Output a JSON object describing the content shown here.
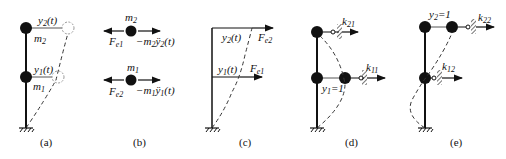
{
  "panels": {
    "a": {
      "caption": "(a)",
      "labels": {
        "y2": "y",
        "y2_sub": "2",
        "y2_arg": "(t)",
        "y1": "y",
        "y1_sub": "1",
        "y1_arg": "(t)",
        "m2": "m",
        "m2_sub": "2",
        "m1": "m",
        "m1_sub": "1"
      }
    },
    "b": {
      "caption": "(b)",
      "top": {
        "mass": "m",
        "mass_sub": "2",
        "left_force": "F",
        "left_force_sub": "e1",
        "right_force": "−m",
        "right_force_sub": "2",
        "right_force_tail": "ÿ",
        "right_force_tail_sub": "2",
        "right_force_arg": "(t)"
      },
      "bottom": {
        "mass": "m",
        "mass_sub": "1",
        "left_force": "F",
        "left_force_sub": "e2",
        "right_force": "−m",
        "right_force_sub": "1",
        "right_force_tail": "ÿ",
        "right_force_tail_sub": "1",
        "right_force_arg": "(t)"
      }
    },
    "c": {
      "caption": "(c)",
      "labels": {
        "y2": "y",
        "y2_sub": "2",
        "y2_arg": "(t)",
        "y1": "y",
        "y1_sub": "1",
        "y1_arg": "(t)",
        "F2": "F",
        "F2_sub": "e2",
        "F1": "F",
        "F1_sub": "e1"
      }
    },
    "d": {
      "caption": "(d)",
      "labels": {
        "k21": "k",
        "k21_sub": "21",
        "k11": "k",
        "k11_sub": "11",
        "y1": "y",
        "y1_sub": "1",
        "y1_val": "=1"
      }
    },
    "e": {
      "caption": "(e)",
      "labels": {
        "k22": "k",
        "k22_sub": "22",
        "k12": "k",
        "k12_sub": "12",
        "y2": "y",
        "y2_sub": "2",
        "y2_val": "=1"
      }
    }
  }
}
